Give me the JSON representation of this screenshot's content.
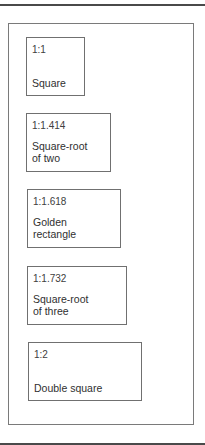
{
  "diagram": {
    "rectangles": [
      {
        "ratio": "1:1",
        "name": "Square",
        "box": {
          "left": 26,
          "top": 37,
          "width": 59,
          "height": 59
        }
      },
      {
        "ratio": "1:1.414",
        "name": "Square-root\nof two",
        "box": {
          "left": 26,
          "top": 113,
          "width": 85,
          "height": 59
        }
      },
      {
        "ratio": "1:1.618",
        "name": "Golden\nrectangle",
        "box": {
          "left": 27,
          "top": 189,
          "width": 94,
          "height": 59
        }
      },
      {
        "ratio": "1:1.732",
        "name": "Square-root\nof three",
        "box": {
          "left": 27,
          "top": 266,
          "width": 100,
          "height": 59
        }
      },
      {
        "ratio": "1:2",
        "name": "Double square",
        "box": {
          "left": 28,
          "top": 342,
          "width": 114,
          "height": 59
        }
      }
    ]
  },
  "colors": {
    "rule": "#4a4a4a",
    "frame_border": "#7a7a7a",
    "box_border": "#707070",
    "text": "#303030",
    "background": "#ffffff"
  }
}
